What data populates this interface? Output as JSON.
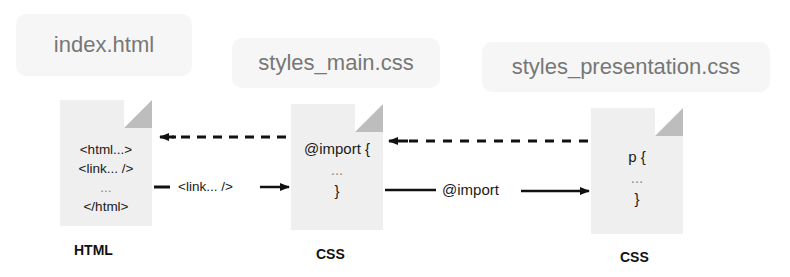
{
  "files": [
    {
      "name": "index.html",
      "type": "HTML",
      "lines": [
        "<html...>",
        "<link... />",
        "...",
        "</html>"
      ]
    },
    {
      "name": "styles_main.css",
      "type": "CSS",
      "lines": [
        "@import {",
        "...",
        "}"
      ]
    },
    {
      "name": "styles_presentation.css",
      "type": "CSS",
      "lines": [
        "p {",
        "...",
        "}"
      ]
    }
  ],
  "arrows": [
    {
      "from": "index.html",
      "to": "styles_main.css",
      "style": "solid",
      "label": "<link... />"
    },
    {
      "from": "styles_main.css",
      "to": "index.html",
      "style": "dashed",
      "label": ""
    },
    {
      "from": "styles_main.css",
      "to": "styles_presentation.css",
      "style": "solid",
      "label": "@import"
    },
    {
      "from": "styles_presentation.css",
      "to": "styles_main.css",
      "style": "dashed",
      "label": ""
    }
  ],
  "colors": {
    "label_bg": "#f6f6f6",
    "label_text": "#777777",
    "doc_bg": "#efefef",
    "doc_fold": "#bdbdbd",
    "arrow": "#111111"
  }
}
